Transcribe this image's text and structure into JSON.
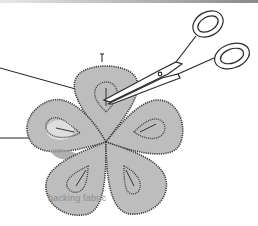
{
  "figure": {
    "label_backing": "backing fabric",
    "colors": {
      "petal_fill": "#bdbdbd",
      "stitch": "#3a3a3a",
      "highlight_light": "#dedede",
      "highlight_dark": "#9e9e9e",
      "scissors_stroke": "#2a2a2a",
      "leader_line": "#222222"
    },
    "petals": [
      {
        "name": "top"
      },
      {
        "name": "left"
      },
      {
        "name": "right"
      },
      {
        "name": "bottom-left"
      },
      {
        "name": "bottom-right"
      }
    ],
    "leader_lines": [
      {
        "name": "upper-leader"
      },
      {
        "name": "lower-leader"
      }
    ]
  }
}
